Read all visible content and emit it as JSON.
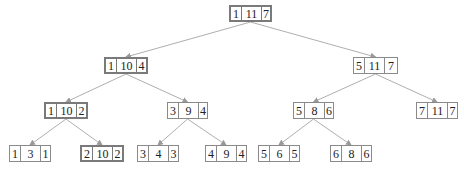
{
  "diagram": {
    "type": "binary-tree",
    "colors": {
      "border": "#8a8a8a",
      "highlight_border": "#7a7a7a",
      "edge": "#999999",
      "text": "#222222"
    },
    "nodes": [
      {
        "id": "n0",
        "values": [
          "1",
          "11",
          "7"
        ],
        "x": 229,
        "y": 5,
        "w": 43,
        "highlight": true
      },
      {
        "id": "n1",
        "values": [
          "1",
          "10",
          "4"
        ],
        "x": 104,
        "y": 57,
        "w": 44,
        "highlight": true
      },
      {
        "id": "n2",
        "values": [
          "5",
          "11",
          "7"
        ],
        "x": 353,
        "y": 57,
        "w": 45,
        "highlight": false
      },
      {
        "id": "n3",
        "values": [
          "1",
          "10",
          "2"
        ],
        "x": 44,
        "y": 102,
        "w": 44,
        "highlight": true
      },
      {
        "id": "n4",
        "values": [
          "3",
          "9",
          "4"
        ],
        "x": 167,
        "y": 102,
        "w": 41,
        "highlight": false
      },
      {
        "id": "n5",
        "values": [
          "5",
          "8",
          "6"
        ],
        "x": 293,
        "y": 102,
        "w": 41,
        "highlight": false
      },
      {
        "id": "n6",
        "values": [
          "7",
          "11",
          "7"
        ],
        "x": 416,
        "y": 102,
        "w": 42,
        "highlight": false
      },
      {
        "id": "n7",
        "values": [
          "1",
          "3",
          "1"
        ],
        "x": 9,
        "y": 145,
        "w": 42,
        "highlight": false
      },
      {
        "id": "n8",
        "values": [
          "2",
          "10",
          "2"
        ],
        "x": 80,
        "y": 145,
        "w": 44,
        "highlight": true
      },
      {
        "id": "n9",
        "values": [
          "3",
          "4",
          "3"
        ],
        "x": 137,
        "y": 145,
        "w": 42,
        "highlight": false
      },
      {
        "id": "n10",
        "values": [
          "4",
          "9",
          "4"
        ],
        "x": 205,
        "y": 145,
        "w": 42,
        "highlight": false
      },
      {
        "id": "n11",
        "values": [
          "5",
          "6",
          "5"
        ],
        "x": 258,
        "y": 145,
        "w": 42,
        "highlight": false
      },
      {
        "id": "n12",
        "values": [
          "6",
          "8",
          "6"
        ],
        "x": 330,
        "y": 145,
        "w": 42,
        "highlight": false
      }
    ],
    "edges": [
      [
        "n0",
        "n1"
      ],
      [
        "n0",
        "n2"
      ],
      [
        "n1",
        "n3"
      ],
      [
        "n1",
        "n4"
      ],
      [
        "n2",
        "n5"
      ],
      [
        "n2",
        "n6"
      ],
      [
        "n3",
        "n7"
      ],
      [
        "n3",
        "n8"
      ],
      [
        "n4",
        "n9"
      ],
      [
        "n4",
        "n10"
      ],
      [
        "n5",
        "n11"
      ],
      [
        "n5",
        "n12"
      ]
    ]
  }
}
